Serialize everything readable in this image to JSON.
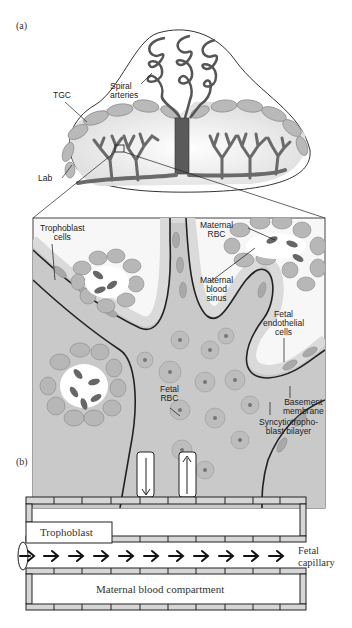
{
  "figure": {
    "panel_a": {
      "label": "(a)",
      "overview_labels": {
        "spiral_arteries": [
          "Spiral",
          "arteries"
        ],
        "tgc": "TGC",
        "lab": "Lab"
      },
      "inset_labels": {
        "trophoblast_cells": [
          "Trophoblast",
          "cells"
        ],
        "maternal_rbc": [
          "Maternal",
          "RBC"
        ],
        "maternal_blood_sinus": [
          "Maternal",
          "blood",
          "sinus"
        ],
        "fetal_endothelial_cells": [
          "Fetal",
          "endothelial",
          "cells"
        ],
        "fetal_rbc": [
          "Fetal",
          "RBC"
        ],
        "basement_membrane": [
          "Basement",
          "membrane"
        ],
        "syncytiotrophoblast_bilayer": [
          "Syncytiotropho-",
          "blast bilayer"
        ]
      }
    },
    "panel_b": {
      "label": "(b)",
      "trophoblast": "Trophoblast",
      "fetal_capillary": [
        "Fetal",
        "capillary"
      ],
      "maternal_blood_compartment": "Maternal blood compartment",
      "arrow_count": 11
    }
  },
  "colors": {
    "cell_fill": "#b8b8b8",
    "cell_stroke": "#8a8a8a",
    "vessel_dark": "#5a5a5a",
    "background_gray": "#d4d4d4",
    "membrane": "#222222",
    "rbc_fill": "#6e6e6e"
  }
}
